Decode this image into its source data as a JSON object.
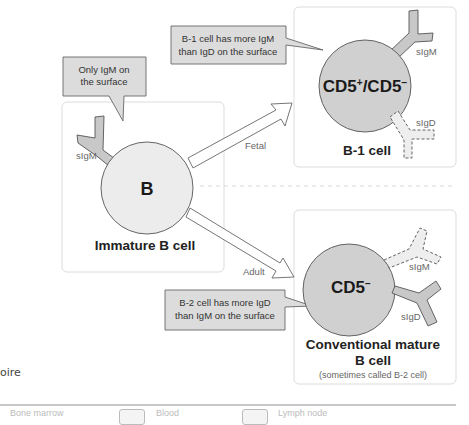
{
  "figure": {
    "callouts": {
      "immature": [
        "Only IgM on",
        "the surface"
      ],
      "b1": [
        "B-1 cell has more IgM",
        "than IgD on the surface"
      ],
      "b2": [
        "B-2 cell has more IgD",
        "than IgM on the surface"
      ]
    },
    "immature_cell": {
      "core_label": "B",
      "title": "Immature B cell",
      "receptor_label": "sIgM"
    },
    "b1_cell": {
      "core_label_base": "CD5",
      "core_sup1": "+",
      "core_sep": "/CD5",
      "core_sup2": "−",
      "title": "B-1 cell",
      "receptor_igm": "sIgM",
      "receptor_igd": "sIgD"
    },
    "b2_cell": {
      "core_label_base": "CD5",
      "core_sup": "−",
      "title_line1": "Conventional mature",
      "title_line2": "B cell",
      "subtitle": "(sometimes called B-2 cell)",
      "receptor_igm": "sIgM",
      "receptor_igd": "sIgD"
    },
    "arrows": {
      "fetal": "Fetal",
      "adult": "Adult"
    },
    "partial_left_text": "oire",
    "colors": {
      "immature_fill": "#ececec",
      "mature_fill": "#d0d0d0",
      "callout_fill": "#dcdcdc",
      "receptor_fill": "#c8c8c8",
      "receptor_faint_fill": "#eeeeee",
      "panel_border": "#dddddd"
    }
  },
  "legend": {
    "items": [
      {
        "label": "Bone marrow"
      },
      {
        "label": "Blood"
      },
      {
        "label": "Lymph node"
      }
    ]
  }
}
